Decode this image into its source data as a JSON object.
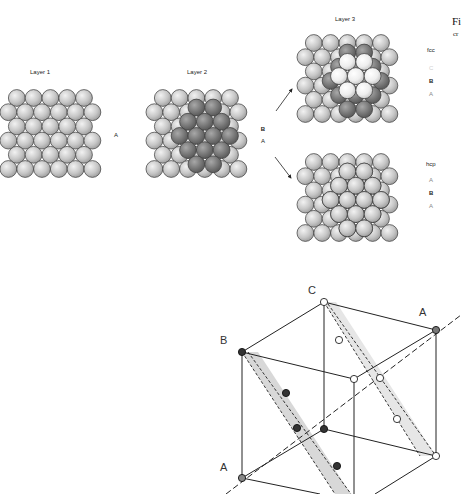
{
  "figure": {
    "top_panel": {
      "layers": [
        {
          "id": "layer1",
          "label": "Layer 1",
          "side_letter": "A"
        },
        {
          "id": "layer2",
          "label": "Layer 2",
          "side_letters": [
            "B",
            "A"
          ]
        },
        {
          "id": "layer3",
          "label": "Layer 3"
        }
      ],
      "fcc": {
        "title": "fcc",
        "stack": [
          "C",
          "B",
          "A"
        ]
      },
      "hcp": {
        "title": "hcp",
        "stack": [
          "A",
          "B",
          "A"
        ]
      },
      "clipped_caption": {
        "line1": "Fi",
        "line2": "cr"
      }
    },
    "bottom_panel": {
      "labels": {
        "top_back": "C",
        "top_right": "A",
        "top_left": "B",
        "bottom_left": "A"
      }
    },
    "colors": {
      "layer_a": "#c8c8c8",
      "layer_b": "#7a7a7a",
      "layer_c": "#f0f0f0",
      "outline": "#333333",
      "plane_fill": "#d6d6d6",
      "plane_fill_light": "#e6e6e6",
      "atom_dark": "#333333",
      "atom_mid": "#777777",
      "atom_white": "#ffffff"
    }
  }
}
